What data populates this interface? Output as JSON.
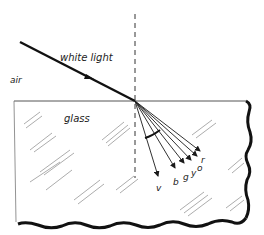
{
  "diagram": {
    "labels": {
      "incident": "white light",
      "medium_top": "air",
      "medium_bottom": "glass"
    },
    "rays": [
      {
        "label": "v",
        "color_name": "violet"
      },
      {
        "label": "b",
        "color_name": "blue"
      },
      {
        "label": "g",
        "color_name": "green"
      },
      {
        "label": "y",
        "color_name": "yellow"
      },
      {
        "label": "o",
        "color_name": "orange"
      },
      {
        "label": "r",
        "color_name": "red"
      }
    ],
    "colors": {
      "ink": "#1a1a1a",
      "hatch": "#888888",
      "background": "#ffffff"
    }
  }
}
